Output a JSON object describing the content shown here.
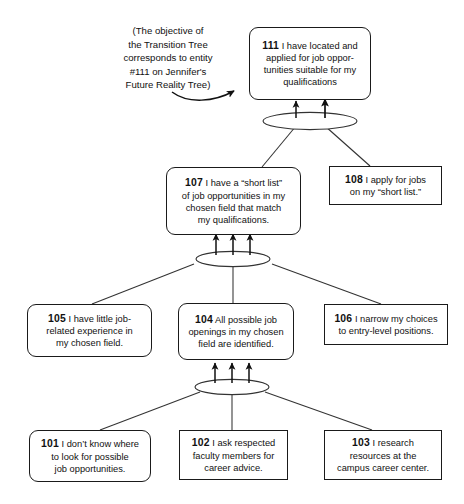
{
  "diagram": {
    "title": "Transition Tree",
    "annotation": {
      "line1": "(The objective of",
      "line2": "the Transition Tree",
      "line3": "corresponds to entity",
      "line4": "#111 on Jennifer's",
      "line5": "Future Reality Tree)"
    },
    "colors": {
      "stroke": "#1a1a1a",
      "ellipse_stroke": "#333333",
      "background": "#ffffff",
      "text": "#111111"
    },
    "nodes": [
      {
        "id": "111",
        "shape": "rounded",
        "lines": [
          "I have located and",
          "applied for job oppor-",
          "tunities suitable for my",
          "qualifications"
        ]
      },
      {
        "id": "107",
        "shape": "rounded",
        "lines": [
          "I have a “short list”",
          "of job opportunities in my",
          "chosen field that match",
          "my qualifications."
        ]
      },
      {
        "id": "108",
        "shape": "square",
        "lines": [
          "I apply for jobs",
          "on my “short list.”"
        ]
      },
      {
        "id": "105",
        "shape": "rounded",
        "lines": [
          "I have little job-",
          "related experience in",
          "my chosen field."
        ]
      },
      {
        "id": "104",
        "shape": "rounded",
        "lines": [
          "All possible job",
          "openings in my chosen",
          "field are identified."
        ]
      },
      {
        "id": "106",
        "shape": "square",
        "lines": [
          "I narrow my choices",
          "to entry-level positions."
        ]
      },
      {
        "id": "101",
        "shape": "rounded",
        "lines": [
          "I don’t know where",
          "to look for possible",
          "job opportunities."
        ]
      },
      {
        "id": "102",
        "shape": "square",
        "lines": [
          "I ask respected",
          "faculty members for",
          "career advice."
        ]
      },
      {
        "id": "103",
        "shape": "square",
        "lines": [
          "I research",
          "resources at the",
          "campus career center."
        ]
      }
    ],
    "connectors": [
      {
        "name": "and-connector-top",
        "inputs": [
          "107",
          "108"
        ],
        "output": "111"
      },
      {
        "name": "and-connector-middle",
        "inputs": [
          "105",
          "104",
          "106"
        ],
        "output": "107"
      },
      {
        "name": "and-connector-bottom",
        "inputs": [
          "101",
          "102",
          "103"
        ],
        "output": "104"
      }
    ]
  }
}
